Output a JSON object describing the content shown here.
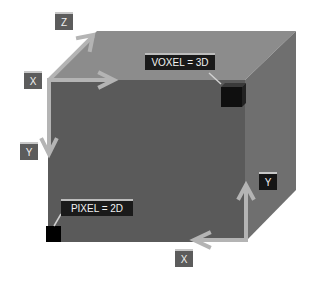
{
  "diagram": {
    "labels": {
      "z_top": "Z",
      "x_top": "X",
      "y_left": "Y",
      "y_right": "Y",
      "x_bottom": "X"
    },
    "callouts": {
      "voxel": "VOXEL = 3D",
      "pixel": "PIXEL = 2D"
    },
    "colors": {
      "front_face": "#5a5a5a",
      "top_face": "#8c8c8c",
      "right_face": "#6f6f6f",
      "arrow": "#b4b4b4",
      "voxel": "#0f0f0f",
      "pixel": "#000000"
    }
  }
}
